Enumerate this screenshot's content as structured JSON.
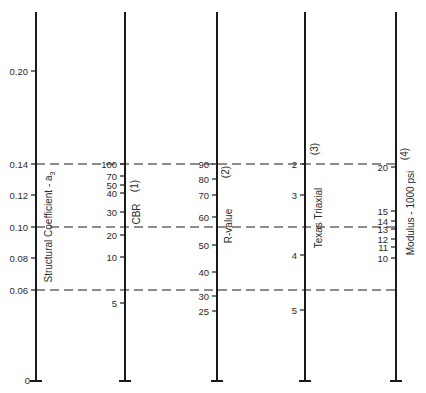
{
  "chart_data": {
    "type": "nomograph",
    "title": "",
    "colors": {
      "ink": "#1a1a1a",
      "background": "#ffffff"
    },
    "axes": [
      {
        "id": "structural-coefficient",
        "label": "Structural Coefficient - a",
        "label_subscript": "3",
        "number": "",
        "x": 36,
        "tick_side": "left",
        "ticks": [
          {
            "label": "0.20",
            "y": 71
          },
          {
            "label": "0.14",
            "y": 164
          },
          {
            "label": "0.12",
            "y": 195
          },
          {
            "label": "0.10",
            "y": 227
          },
          {
            "label": "0.08",
            "y": 258
          },
          {
            "label": "0.06",
            "y": 290
          },
          {
            "label": "0",
            "y": 381
          }
        ],
        "label_x": 52,
        "label_y": 227
      },
      {
        "id": "cbr",
        "label": "CBR",
        "number": "(1)",
        "x": 125,
        "tick_side": "left",
        "ticks": [
          {
            "label": "100",
            "y": 164
          },
          {
            "label": "70",
            "y": 176
          },
          {
            "label": "50",
            "y": 185
          },
          {
            "label": "40",
            "y": 193
          },
          {
            "label": "30",
            "y": 212
          },
          {
            "label": "20",
            "y": 235
          },
          {
            "label": "10",
            "y": 257
          },
          {
            "label": "5",
            "y": 303
          }
        ],
        "label_x": 140,
        "label_y": 214,
        "number_x": 138,
        "number_y": 186
      },
      {
        "id": "r-value",
        "label": "R-value",
        "number": "(2)",
        "x": 217,
        "tick_side": "left",
        "ticks": [
          {
            "label": "90",
            "y": 164
          },
          {
            "label": "80",
            "y": 179
          },
          {
            "label": "70",
            "y": 195
          },
          {
            "label": "60",
            "y": 217
          },
          {
            "label": "50",
            "y": 245
          },
          {
            "label": "40",
            "y": 272
          },
          {
            "label": "30",
            "y": 296
          },
          {
            "label": "25",
            "y": 311
          }
        ],
        "label_x": 232,
        "label_y": 226,
        "number_x": 229,
        "number_y": 172
      },
      {
        "id": "texas-triaxial",
        "label": "Texas Triaxial",
        "number": "(3)",
        "x": 305,
        "tick_side": "left",
        "ticks": [
          {
            "label": "2",
            "y": 164
          },
          {
            "label": "3",
            "y": 195
          },
          {
            "label": "4",
            "y": 255
          },
          {
            "label": "5",
            "y": 310
          }
        ],
        "label_x": 322,
        "label_y": 218,
        "number_x": 318,
        "number_y": 149
      },
      {
        "id": "modulus",
        "label": "Modulus - 1000 psi",
        "number": "(4)",
        "x": 396,
        "tick_side": "left",
        "ticks": [
          {
            "label": "20",
            "y": 167
          },
          {
            "label": "15",
            "y": 211
          },
          {
            "label": "14",
            "y": 221
          },
          {
            "label": "13",
            "y": 229
          },
          {
            "label": "12",
            "y": 239
          },
          {
            "label": "11",
            "y": 247
          },
          {
            "label": "10",
            "y": 258
          }
        ],
        "label_x": 414,
        "label_y": 213,
        "number_x": 408,
        "number_y": 154
      }
    ],
    "axis_top": 12,
    "axis_bottom": 381,
    "guide_lines": [
      {
        "y": 164,
        "from_x": 36,
        "to_x": 396,
        "style": "dashed",
        "reads": {
          "a3": "0.14",
          "cbr": "100",
          "r_value": "90",
          "texas_triaxial": "2",
          "modulus": "20"
        }
      },
      {
        "y": 227,
        "from_x": 36,
        "to_x": 396,
        "style": "dashed",
        "reads": {
          "a3": "0.10",
          "cbr": "~22",
          "r_value": "~57",
          "texas_triaxial": "~3.6",
          "modulus": "~13.5"
        }
      },
      {
        "y": 290,
        "from_x": 36,
        "to_x": 396,
        "style": "dashed",
        "reads": {
          "a3": "0.06",
          "cbr": "~6",
          "r_value": "~32",
          "texas_triaxial": "~4.7",
          "modulus": ""
        }
      }
    ],
    "legend": null,
    "grid": false
  }
}
